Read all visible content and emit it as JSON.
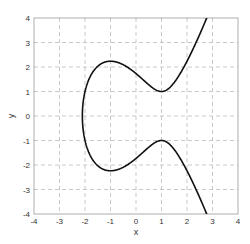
{
  "chart_data": {
    "type": "line",
    "title": "",
    "xlabel": "x",
    "ylabel": "y",
    "xlim": [
      -4,
      4
    ],
    "ylim": [
      -4,
      4
    ],
    "xticks": [
      -4,
      -3,
      -2,
      -1,
      0,
      1,
      2,
      3,
      4
    ],
    "yticks": [
      -4,
      -3,
      -2,
      -1,
      0,
      1,
      2,
      3,
      4
    ],
    "grid": true,
    "grid_style": "dashed",
    "legend": null,
    "series": [
      {
        "name": "y^2 = x^3 - 3x + 3",
        "equation": "y^2 = x^3 - 3x + 3",
        "color": "#111111",
        "key_points": [
          {
            "x": -2.1,
            "y": 0
          },
          {
            "x": -1,
            "y": 2.24
          },
          {
            "x": -1,
            "y": -2.24
          },
          {
            "x": 1,
            "y": 1
          },
          {
            "x": 1,
            "y": -1
          },
          {
            "x": 2.77,
            "y": 4
          },
          {
            "x": 2.77,
            "y": -4
          }
        ]
      }
    ]
  },
  "colors": {
    "curve": "#111111",
    "grid": "#bbbbbb",
    "axes": "#999999",
    "text": "#333333"
  },
  "plot_area": {
    "left": 34,
    "top": 18,
    "right": 238,
    "bottom": 214
  }
}
